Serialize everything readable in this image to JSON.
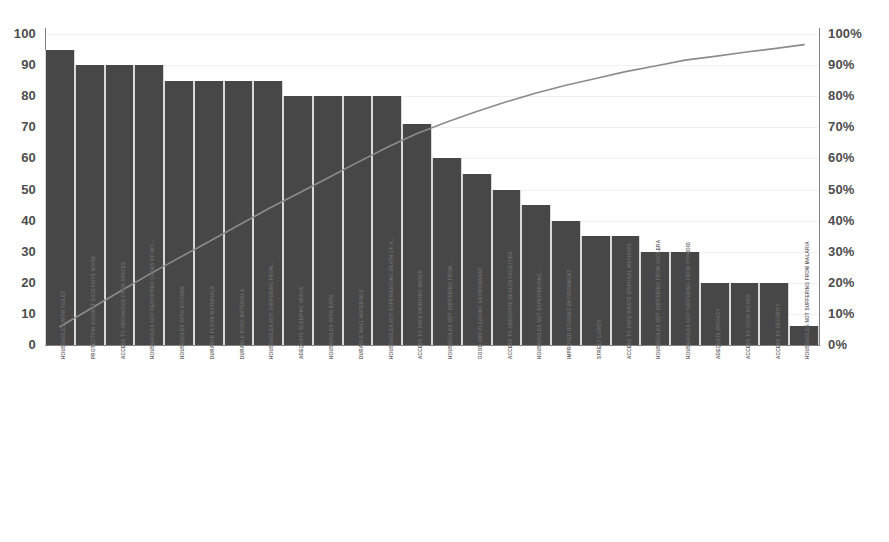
{
  "chart_data": {
    "type": "bar",
    "title": "",
    "subtitle": "",
    "xlabel": "",
    "ylabel": "",
    "y2label": "",
    "grid": true,
    "legend": "none",
    "ylim": [
      0,
      100
    ],
    "y2lim": [
      0,
      100
    ],
    "yticks": [
      "0",
      "10",
      "20",
      "30",
      "40",
      "50",
      "60",
      "70",
      "80",
      "90",
      "100"
    ],
    "y2ticks": [
      "0%",
      "10%",
      "20%",
      "30%",
      "40%",
      "50%",
      "60%",
      "70%",
      "80%",
      "90%",
      "100%"
    ],
    "categories": [
      "HOUSEHOLDS WITH TOILET",
      "PROTECTION AGAINST EXCESSIVE NOISE",
      "ACCESS TO ORGANIZED OPEN SPACES",
      "HOUSEHOLDS NOT REPORTING CASES OF HIV...",
      "HOUSEHOLDS WITH KITCHEN",
      "DURABLE FLOOR MATERIALS",
      "DURABLE ROOF MATERIALS",
      "HOUSEHOLDS NOT SUFFERING FROM...",
      "ADEQUATE SLEEPING SPACE",
      "HOUSEHOLDS WITH BATH",
      "DURABLE WALL MATERIALS",
      "HOUSEHOLDS NOT EXPERIENCING DEATH OF A...",
      "ACCESS TO SAFE DRINKING WATER",
      "HOUSEHOLDS NOT SUFFERING FROM...",
      "GOOD AND PLEASING ENVIRONMENT",
      "ACCESS TO ADEQUATE HEALTH FACILITIES",
      "HOUSEHOLDS NOT EXPERIENCING...",
      "IMPROVED HOUSING ENVIRONMENT",
      "STREET LIGHTS",
      "ACCESS TO SAFE WASTE DISPOSAL METHODS",
      "HOUSEHOLDS NOT SUFFERING FROM CHOLERA",
      "HOUSEHOLDS NOT SUFFERING FROM TYPHOID",
      "ADEQUATE PRIVACY",
      "ACCESS TO GOOD ROADS",
      "ACCESS TO SECURITY",
      "HOUSEHOLDS NOT SUFFERING FROM MALARIA"
    ],
    "values": [
      95,
      90,
      90,
      90,
      85,
      85,
      85,
      85,
      80,
      80,
      80,
      80,
      71,
      60,
      55,
      50,
      45,
      40,
      35,
      35,
      30,
      30,
      20,
      20,
      20,
      6
    ],
    "cumulative_percent": [
      5.9,
      11.5,
      17.1,
      22.7,
      28.0,
      33.2,
      38.5,
      43.8,
      48.7,
      53.7,
      58.7,
      63.6,
      68.0,
      71.7,
      75.1,
      78.2,
      81.0,
      83.5,
      85.7,
      87.9,
      89.7,
      91.6,
      92.8,
      94.1,
      95.3,
      96.6
    ],
    "series": [
      {
        "name": "count",
        "type": "bar",
        "axis": "left",
        "color": "#474747",
        "values": [
          95,
          90,
          90,
          90,
          85,
          85,
          85,
          85,
          80,
          80,
          80,
          80,
          71,
          60,
          55,
          50,
          45,
          40,
          35,
          35,
          30,
          30,
          20,
          20,
          20,
          6
        ]
      },
      {
        "name": "cumulative",
        "type": "line",
        "axis": "right",
        "color": "#8c8c8c",
        "values": [
          5.9,
          11.5,
          17.1,
          22.7,
          28.0,
          33.2,
          38.5,
          43.8,
          48.7,
          53.7,
          58.7,
          63.6,
          68.0,
          71.7,
          75.1,
          78.2,
          81.0,
          83.5,
          85.7,
          87.9,
          89.7,
          91.6,
          92.8,
          94.1,
          95.3,
          96.6
        ]
      }
    ]
  },
  "colors": {
    "bar": "#474747",
    "line": "#8c8c8c",
    "grid": "#f0f0f0",
    "axis": "#808080",
    "tick_text": "#4d4d4d",
    "category_text": "#6b6b6b",
    "background": "#ffffff"
  }
}
